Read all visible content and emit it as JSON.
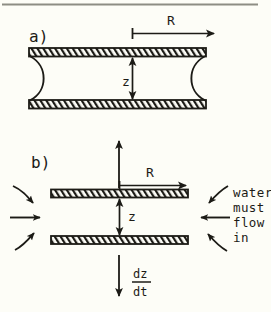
{
  "figure": {
    "background_color": "#fdfdf7",
    "ink_color": "#1c1b16",
    "top_border": true
  },
  "panels": [
    {
      "id": "a",
      "label": "a)",
      "description": "two parallel plates with liquid bridge and concave menisci at both ends",
      "dimensions": {
        "radial_label": "R",
        "gap_label": "z"
      }
    },
    {
      "id": "b",
      "label": "b)",
      "description": "two parallel plates separating, water must flow in from the sides",
      "dimensions": {
        "radial_label": "R",
        "gap_label": "z",
        "separation_rate_numerator": "dz",
        "separation_rate_denominator": "dt"
      },
      "annotation": {
        "line1": "water",
        "line2": "must",
        "line3": "flow",
        "line4": "in"
      }
    }
  ],
  "icons": {
    "arrow_right": "arrow-right-icon",
    "arrow_up": "arrow-up-icon",
    "arrow_down": "arrow-down-icon",
    "arrow_double_vertical": "double-headed-vertical-arrow-icon",
    "arrow_curved": "curved-inflow-arrow-icon"
  }
}
